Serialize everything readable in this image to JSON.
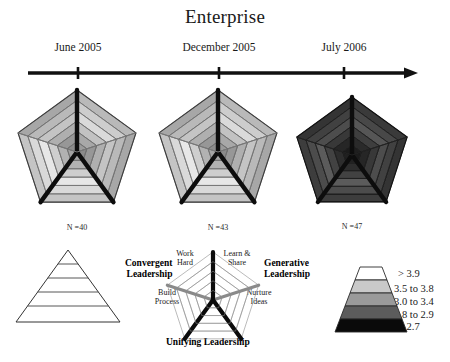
{
  "figure": {
    "title": "Enterprise",
    "width": 450,
    "height": 362
  },
  "timeline": {
    "axis_name": "time-arrow",
    "ticks": [
      {
        "label": "June 2005",
        "x": 78
      },
      {
        "label": "December 2005",
        "x": 219
      },
      {
        "label": "July 2006",
        "x": 344
      }
    ]
  },
  "panels": [
    {
      "period": "June 2005",
      "n_label": "N =40",
      "n": 40,
      "cx": 77,
      "cy": 152,
      "r": 62,
      "tone": "light"
    },
    {
      "period": "December 2005",
      "n_label": "N =43",
      "n": 43,
      "cx": 218,
      "cy": 152,
      "r": 62,
      "tone": "light"
    },
    {
      "period": "July 2006",
      "n_label": "N =47",
      "n": 47,
      "cx": 352,
      "cy": 155,
      "r": 58,
      "tone": "dark"
    }
  ],
  "maturity_pyramid": {
    "name": "maturity-pyramid",
    "levels": [
      "Engage",
      "Decisions",
      "Execution",
      "Road Map"
    ]
  },
  "model_legend": {
    "name": "leadership-model",
    "axes": [
      {
        "label": "Work Hard",
        "position": "upper-left"
      },
      {
        "label": "Learn & Share",
        "position": "upper-right"
      },
      {
        "label": "Build Process",
        "position": "lower-left"
      },
      {
        "label": "Nurture Ideas",
        "position": "lower-right"
      }
    ],
    "quadrants": [
      {
        "line1": "Convergent",
        "line2": "Leadership",
        "position": "left"
      },
      {
        "line1": "Generative",
        "line2": "Leadership",
        "position": "right"
      },
      {
        "line1": "Unifying Leadership",
        "line2": "",
        "position": "bottom"
      }
    ]
  },
  "scale_legend": {
    "name": "score-scale-legend",
    "bands": [
      {
        "label": "> 3.9",
        "color": "#ffffff"
      },
      {
        "label": "3.5 to 3.8",
        "color": "#c9c9c9"
      },
      {
        "label": "3.0 to 3.4",
        "color": "#9a9a9a"
      },
      {
        "label": "2.8 to 2.9",
        "color": "#5c5c5c"
      },
      {
        "label": "< 2.7",
        "color": "#0a0a0a"
      }
    ]
  },
  "colors": {
    "ink": "#111111",
    "band_white": "#ffffff",
    "band_light": "#c9c9c9",
    "band_mid": "#9a9a9a",
    "band_dark": "#5c5c5c",
    "band_black": "#0a0a0a",
    "spoke": "#0d0d0d",
    "grid": "#6f6f6f"
  }
}
